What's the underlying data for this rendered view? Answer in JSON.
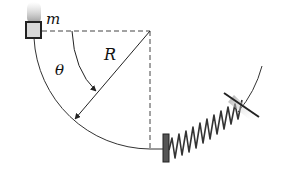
{
  "diagram": {
    "labels": {
      "mass": "m",
      "angle": "θ",
      "radius": "R"
    },
    "colors": {
      "stroke": "#222222",
      "dashed": "#444444",
      "block_fill": "#d8d8d8",
      "spring": "#333333"
    },
    "elements": [
      "block-mass",
      "circular-track",
      "radius-arrow",
      "angle-arrow",
      "horizontal-dashed-line",
      "vertical-dashed-line",
      "spring",
      "spring-bumper",
      "wall-mount"
    ]
  }
}
